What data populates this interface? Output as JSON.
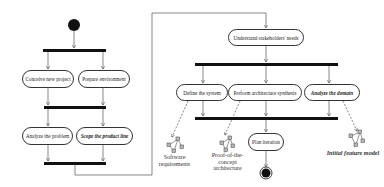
{
  "diagram": {
    "type": "UML activity diagram",
    "left_flow": {
      "start_node": "initial-node",
      "activities": [
        {
          "id": "conceive",
          "label": "Conceive new project",
          "italic": false
        },
        {
          "id": "prepare",
          "label": "Prepare environment",
          "italic": false
        },
        {
          "id": "analyze-problem",
          "label": "Analyze the problem",
          "italic": false
        },
        {
          "id": "scope",
          "label": "Scope the product line",
          "italic": true
        }
      ]
    },
    "right_flow": {
      "activities": [
        {
          "id": "understand",
          "label": "Understand stakeholders' needs",
          "italic": false
        },
        {
          "id": "define",
          "label": "Define the system",
          "italic": false
        },
        {
          "id": "perform",
          "label": "Perform architecture synthesis",
          "italic": false
        },
        {
          "id": "analyze-domain",
          "label": "Analyze the domain",
          "italic": true
        },
        {
          "id": "plan",
          "label": "Plan iteration",
          "italic": false
        }
      ],
      "end_node": "final-node"
    },
    "artifacts": [
      {
        "id": "software-req",
        "label_lines": [
          "Software",
          "requirements"
        ],
        "italic": false
      },
      {
        "id": "proof",
        "label_lines": [
          "Proof-of-the-",
          "concept",
          "architecture"
        ],
        "italic": false
      },
      {
        "id": "feature-model",
        "label_lines": [
          "Initial feature model"
        ],
        "italic": true
      }
    ]
  }
}
